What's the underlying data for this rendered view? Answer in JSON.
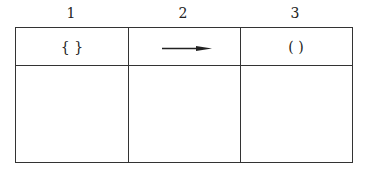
{
  "columns": [
    {
      "number": "1",
      "symbol": "{  }"
    },
    {
      "number": "2",
      "symbol": "arrow-right"
    },
    {
      "number": "3",
      "symbol": "(    )"
    }
  ],
  "rows": 2,
  "colors": {
    "line": "#333333",
    "background": "#ffffff"
  }
}
